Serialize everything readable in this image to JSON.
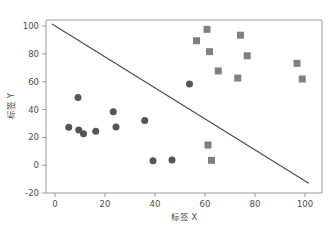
{
  "chart_data": {
    "type": "scatter",
    "title": "",
    "xlabel": "标签 X",
    "ylabel": "标签 Y",
    "xlim": [
      -3,
      104
    ],
    "ylim": [
      -22,
      106
    ],
    "xticks": [
      0,
      20,
      40,
      60,
      80,
      100
    ],
    "yticks": [
      -20,
      0,
      20,
      40,
      60,
      80,
      100
    ],
    "xtick_labels": [
      "0",
      "20",
      "40",
      "60",
      "80",
      "100"
    ],
    "ytick_labels": [
      "-20",
      "0",
      "20",
      "40",
      "60",
      "80",
      "100"
    ],
    "grid": false,
    "legend": "none",
    "series": [
      {
        "name": "class-0",
        "marker": "circle",
        "color": "#555555",
        "size": 7,
        "points": [
          {
            "x": 5.5,
            "y": 27.2
          },
          {
            "x": 9.2,
            "y": 48.6
          },
          {
            "x": 9.5,
            "y": 25.3
          },
          {
            "x": 11.4,
            "y": 22.6
          },
          {
            "x": 16.3,
            "y": 24.3
          },
          {
            "x": 23.3,
            "y": 38.4
          },
          {
            "x": 24.4,
            "y": 27.5
          },
          {
            "x": 35.9,
            "y": 32.1
          },
          {
            "x": 39.2,
            "y": 3.2
          },
          {
            "x": 46.8,
            "y": 3.8
          },
          {
            "x": 53.8,
            "y": 58.4
          }
        ]
      },
      {
        "name": "class-1",
        "marker": "square",
        "color": "#808080",
        "size": 7,
        "points": [
          {
            "x": 56.6,
            "y": 89.4
          },
          {
            "x": 60.8,
            "y": 97.6
          },
          {
            "x": 61.8,
            "y": 81.6
          },
          {
            "x": 61.2,
            "y": 14.5
          },
          {
            "x": 62.6,
            "y": 3.5
          },
          {
            "x": 65.3,
            "y": 67.7
          },
          {
            "x": 73.1,
            "y": 62.6
          },
          {
            "x": 74.2,
            "y": 93.4
          },
          {
            "x": 76.9,
            "y": 78.6
          },
          {
            "x": 96.8,
            "y": 73.2
          },
          {
            "x": 98.9,
            "y": 61.9
          }
        ]
      }
    ],
    "decision_boundary": {
      "name": "decision-boundary",
      "color": "#4d4d4d",
      "x0": -1.2,
      "y0": 101.5,
      "x1": 101.5,
      "y1": -13.0
    }
  }
}
